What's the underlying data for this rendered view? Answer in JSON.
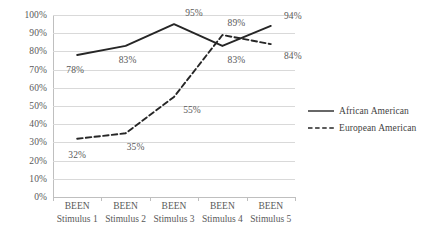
{
  "chart_data": {
    "type": "line",
    "title": "",
    "subtitle": "",
    "xlabel": "",
    "ylabel": "",
    "ylim": [
      0,
      100
    ],
    "y_tick_labels": [
      "0%",
      "10%",
      "20%",
      "30%",
      "40%",
      "50%",
      "60%",
      "70%",
      "80%",
      "90%",
      "100%"
    ],
    "y_ticks": [
      0,
      10,
      20,
      30,
      40,
      50,
      60,
      70,
      80,
      90,
      100
    ],
    "grid": true,
    "legend_position": "right",
    "categories": [
      "BEEN Stimulus 1",
      "BEEN Stimulus 2",
      "BEEN Stimulus 3",
      "BEEN Stimulus 4",
      "BEEN Stimulus 5"
    ],
    "category_lines": [
      {
        "line1": "BEEN",
        "line2": "Stimulus 1"
      },
      {
        "line1": "BEEN",
        "line2": "Stimulus 2"
      },
      {
        "line1": "BEEN",
        "line2": "Stimulus 3"
      },
      {
        "line1": "BEEN",
        "line2": "Stimulus 4"
      },
      {
        "line1": "BEEN",
        "line2": "Stimulus 5"
      }
    ],
    "series": [
      {
        "name": "African American",
        "style": "solid",
        "color": "#262626",
        "values": [
          78,
          83,
          95,
          83,
          94
        ],
        "data_labels": [
          "78%",
          "83%",
          "95%",
          "83%",
          "94%"
        ]
      },
      {
        "name": "European American",
        "style": "dashed",
        "color": "#262626",
        "values": [
          32,
          35,
          55,
          89,
          84
        ],
        "data_labels": [
          "32%",
          "35%",
          "55%",
          "89%",
          "84%"
        ]
      }
    ]
  },
  "legend": {
    "items": [
      {
        "label": "African American",
        "style": "solid"
      },
      {
        "label": "European American",
        "style": "dashed"
      }
    ]
  },
  "colors": {
    "gridline": "#d9d9d9",
    "axis": "#bfbfbf",
    "text": "#595959",
    "series": "#262626",
    "background": "#ffffff"
  }
}
